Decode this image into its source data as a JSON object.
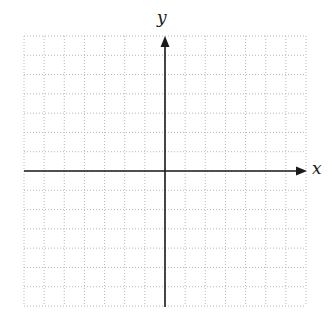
{
  "diagram": {
    "type": "coordinate-plane",
    "axes": {
      "x_label": "x",
      "y_label": "y"
    },
    "grid": {
      "columns": 14,
      "rows": 14,
      "style": "dotted",
      "color": "#b8b8b8"
    },
    "colors": {
      "axis": "#1a1a1a",
      "background": "#ffffff"
    }
  }
}
